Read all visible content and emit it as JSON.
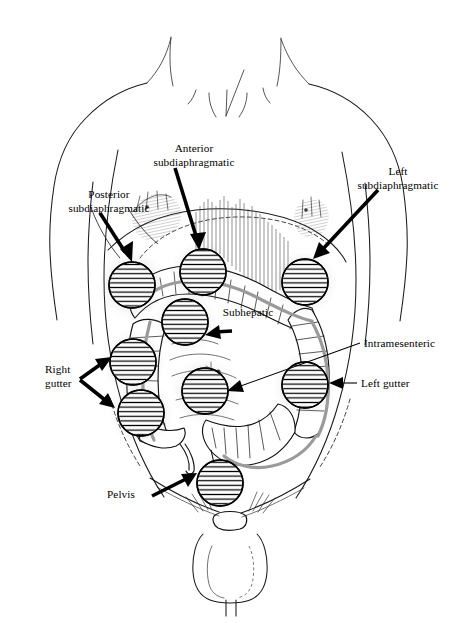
{
  "figure": {
    "width": 469,
    "height": 623,
    "background_color": "#ffffff",
    "line_color": "#000000"
  },
  "labels": [
    {
      "id": "anterior-subdiaphragmatic",
      "lines": [
        "Anterior",
        "subdiaphragmatic"
      ],
      "text_x": 194,
      "text_y": 152,
      "align": "middle",
      "arrow": "thick-down-right"
    },
    {
      "id": "left-subdiaphragmatic",
      "lines": [
        "Left",
        "subdiaphragmatic"
      ],
      "text_x": 398,
      "text_y": 175,
      "align": "middle",
      "arrow": "thick-down-left"
    },
    {
      "id": "posterior-subdiaphragmatic",
      "lines": [
        "Posterior",
        "subdiaphragmatic"
      ],
      "text_x": 109,
      "text_y": 198,
      "align": "middle",
      "arrow": "thick-down-right"
    },
    {
      "id": "subhepatic",
      "lines": [
        "Subhepatic"
      ],
      "text_x": 248,
      "text_y": 316,
      "align": "middle",
      "arrow": "thick-left"
    },
    {
      "id": "intramesenteric",
      "lines": [
        "Intramesenteric"
      ],
      "text_x": 364,
      "text_y": 347,
      "align": "start",
      "arrow": "thin-long-left"
    },
    {
      "id": "left-gutter",
      "lines": [
        "Left gutter"
      ],
      "text_x": 361,
      "text_y": 387,
      "align": "start",
      "arrow": "thin-left"
    },
    {
      "id": "right-gutter",
      "lines": [
        "Right",
        "gutter"
      ],
      "text_x": 45,
      "text_y": 373,
      "align": "start",
      "arrow": "thick-fork-right"
    },
    {
      "id": "pelvis",
      "lines": [
        "Pelvis"
      ],
      "text_x": 107,
      "text_y": 498,
      "align": "start",
      "arrow": "thick-up-right"
    }
  ],
  "sites": [
    {
      "id": "site-posterior-subdiaphragmatic",
      "name": "posterior subdiaphragmatic",
      "cx": 132,
      "cy": 285,
      "r": 23
    },
    {
      "id": "site-anterior-subdiaphragmatic",
      "name": "anterior subdiaphragmatic",
      "cx": 203,
      "cy": 272,
      "r": 23
    },
    {
      "id": "site-left-subdiaphragmatic",
      "name": "left subdiaphragmatic",
      "cx": 305,
      "cy": 282,
      "r": 23
    },
    {
      "id": "site-subhepatic",
      "name": "subhepatic",
      "cx": 185,
      "cy": 322,
      "r": 23
    },
    {
      "id": "site-right-gutter-upper",
      "name": "right gutter upper",
      "cx": 133,
      "cy": 362,
      "r": 23
    },
    {
      "id": "site-intramesenteric",
      "name": "intramesenteric",
      "cx": 205,
      "cy": 391,
      "r": 23
    },
    {
      "id": "site-left-gutter",
      "name": "left gutter",
      "cx": 305,
      "cy": 385,
      "r": 23
    },
    {
      "id": "site-right-gutter-lower",
      "name": "right gutter lower",
      "cx": 141,
      "cy": 413,
      "r": 23
    },
    {
      "id": "site-pelvis",
      "name": "pelvis",
      "cx": 220,
      "cy": 483,
      "r": 23
    }
  ],
  "anatomy_parts": [
    "neck",
    "shoulders",
    "torso-outline",
    "liver",
    "spleen",
    "diaphragm-margin",
    "ascending-colon",
    "transverse-colon",
    "descending-colon",
    "sigmoid-colon",
    "cecum",
    "appendix",
    "small-bowel",
    "inguinal-region",
    "genitalia"
  ]
}
